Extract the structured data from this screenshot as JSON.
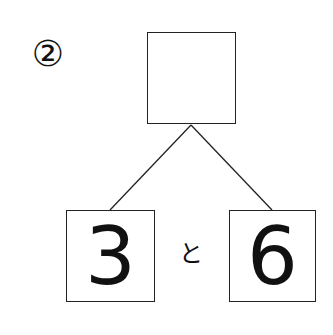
{
  "problem": {
    "number_label": "②",
    "top_box_value": "",
    "left_box_value": "3",
    "connector": "と",
    "right_box_value": "6"
  }
}
